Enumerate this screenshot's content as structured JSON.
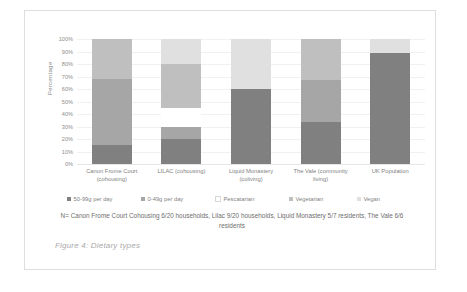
{
  "figure": {
    "caption": "Figure 4: Dietary types",
    "n_note": "N= Canon Frome Court Cohousing 6/20 households, Lilac 9/20 households, Liquid Monastery 5/7 residents, The Vale 6/6 residents"
  },
  "chart_data": {
    "type": "bar",
    "stacked": true,
    "stack_mode": "percent",
    "title": "",
    "xlabel": "",
    "ylabel": "Percentage",
    "ylim": [
      0,
      100
    ],
    "grid": true,
    "legend_position": "bottom",
    "categories": [
      "Canon Frome Court (cohousing)",
      "LILAC (cohousing)",
      "Liquid Monastery (coliving)",
      "The Vale (community living)",
      "UK Population"
    ],
    "category_lines": [
      [
        "Canon Frome Court",
        "(cohousing)"
      ],
      [
        "LILAC (cohousing)"
      ],
      [
        "Liquid Monastery",
        "(coliving)"
      ],
      [
        "The Vale (community",
        "living)"
      ],
      [
        "UK Population"
      ]
    ],
    "ytick_labels": [
      "0%",
      "10%",
      "20%",
      "30%",
      "40%",
      "50%",
      "60%",
      "70%",
      "80%",
      "90%",
      "100%"
    ],
    "ytick_values": [
      0,
      10,
      20,
      30,
      40,
      50,
      60,
      70,
      80,
      90,
      100
    ],
    "series": [
      {
        "name": "50-99g per day",
        "color": "#808080",
        "values": [
          15,
          20,
          60,
          34,
          89
        ]
      },
      {
        "name": "0-49g per day",
        "color": "#a6a6a6",
        "values": [
          53,
          10,
          0,
          33,
          0
        ]
      },
      {
        "name": "Pescatarian",
        "color": "#ffffff",
        "values": [
          0,
          15,
          0,
          0,
          0
        ]
      },
      {
        "name": "Vegetarian",
        "color": "#bfbfbf",
        "values": [
          32,
          35,
          0,
          33,
          0
        ]
      },
      {
        "name": "Vegan",
        "color": "#e0e0e0",
        "values": [
          0,
          20,
          40,
          0,
          11
        ]
      }
    ]
  }
}
